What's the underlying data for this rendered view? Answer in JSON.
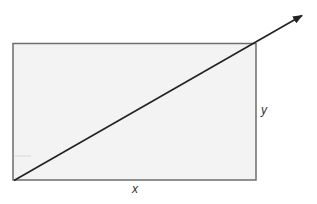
{
  "diagram": {
    "type": "rectangle-with-diagonal-vector",
    "rectangle": {
      "x": 13,
      "y": 43,
      "width": 243,
      "height": 137,
      "fill": "#f3f3f3",
      "stroke": "#6e6e6e"
    },
    "diagonal": {
      "from": [
        14,
        180
      ],
      "to": [
        303,
        15
      ],
      "stroke": "#222222",
      "arrowhead": "end"
    },
    "labels": {
      "x": "x",
      "y": "y"
    },
    "artifact_tick": {
      "from": [
        14,
        156
      ],
      "to": [
        31,
        156
      ],
      "stroke": "#d8d8d8"
    }
  }
}
